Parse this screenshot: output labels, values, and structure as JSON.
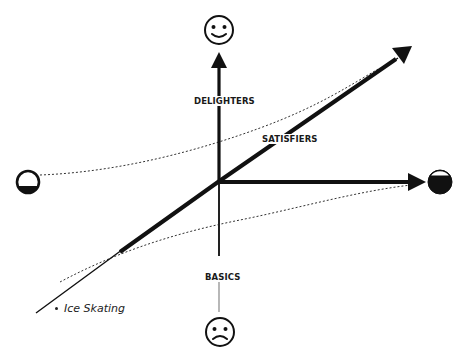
{
  "diagram": {
    "type": "kano-model",
    "axes": {
      "vertical_top_icon": "smiley-face-icon",
      "vertical_bottom_icon": "frowning-face-icon",
      "horizontal_left_icon": "empty-circle-icon",
      "horizontal_right_icon": "full-circle-icon"
    },
    "curves": {
      "delighters": "DELIGHTERS",
      "satisfiers": "SATISFIERS",
      "basics": "BASICS"
    },
    "items": [
      {
        "label": "Ice Skating"
      }
    ],
    "colors": {
      "ink": "#111111",
      "background": "#ffffff",
      "dotted": "#333333"
    }
  }
}
